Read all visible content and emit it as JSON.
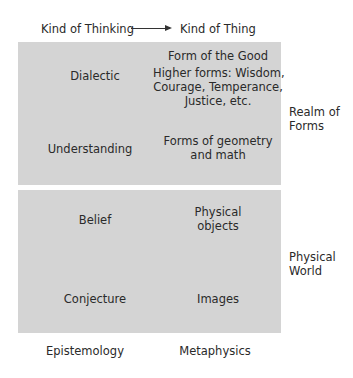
{
  "header": {
    "left": "Kind of Thinking",
    "right": "Kind of Thing",
    "arrow_icon": "right-arrow"
  },
  "realm_of_forms": {
    "label_line1": "Realm of",
    "label_line2": "Forms",
    "rows": [
      {
        "thinking": "Dialectic",
        "thing_top": "Form of the Good",
        "thing_lines": [
          "Higher forms: Wisdom,",
          "Courage, Temperance,",
          "Justice, etc."
        ]
      },
      {
        "thinking": "Understanding",
        "thing_lines": [
          "Forms of geometry",
          "and math"
        ]
      }
    ]
  },
  "physical_world": {
    "label_line1": "Physical",
    "label_line2": "World",
    "rows": [
      {
        "thinking": "Belief",
        "thing_lines": [
          "Physical",
          "objects"
        ]
      },
      {
        "thinking": "Conjecture",
        "thing_lines": [
          "Images"
        ]
      }
    ]
  },
  "footer": {
    "left": "Epistemology",
    "right": "Metaphysics"
  },
  "colors": {
    "box": "#d4d4d4",
    "text": "#2a2a2a",
    "background": "#ffffff"
  }
}
